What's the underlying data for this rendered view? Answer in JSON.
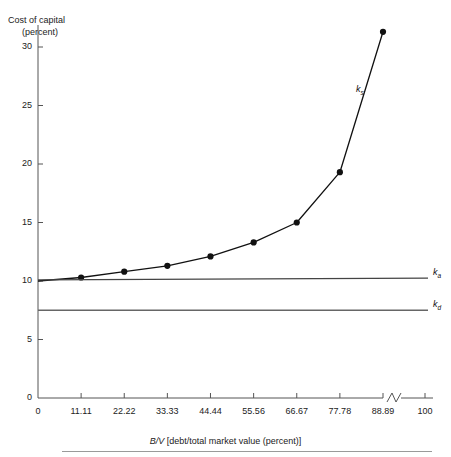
{
  "chart_data": {
    "type": "line",
    "title": "",
    "ylabel": "Cost of capital (percent)",
    "ylabel_line1": "Cost of capital",
    "ylabel_line2": "(percent)",
    "xlabel": "B/V [debt/total market value (percent)]",
    "xlabel_italic": "B/V",
    "xlabel_rest": " [debt/total market value (percent)]",
    "xlim": [
      0,
      100
    ],
    "ylim": [
      0,
      32
    ],
    "grid": false,
    "axis_break": {
      "between": [
        88.89,
        100
      ],
      "symbol": "zigzag"
    },
    "yticks": [
      0,
      5,
      10,
      15,
      20,
      25,
      30
    ],
    "ytick_labels": [
      "0",
      "5",
      "10",
      "15",
      "20",
      "25",
      "30"
    ],
    "xticks": [
      0,
      11.11,
      22.22,
      33.33,
      44.44,
      55.56,
      66.67,
      77.78,
      88.89,
      100
    ],
    "xtick_labels": [
      "0",
      "11.11",
      "22.22",
      "33.33",
      "44.44",
      "55.56",
      "66.67",
      "77.78",
      "88.89",
      "100"
    ],
    "series": [
      {
        "name": "k_s",
        "label": "k",
        "subscript": "s",
        "style": "curve-with-markers",
        "color": "#111111",
        "x": [
          0,
          11.11,
          22.22,
          33.33,
          44.44,
          55.56,
          66.67,
          77.78,
          88.89
        ],
        "values": [
          10.0,
          10.3,
          10.8,
          11.3,
          12.1,
          13.3,
          15.0,
          19.3,
          31.3
        ]
      },
      {
        "name": "k_a",
        "label": "k",
        "subscript": "a",
        "style": "horizontal-line",
        "color": "#444444",
        "x": [
          0,
          100
        ],
        "values": [
          10.1,
          10.25
        ]
      },
      {
        "name": "k_d",
        "label": "k",
        "subscript": "d",
        "style": "horizontal-line",
        "color": "#666666",
        "x": [
          0,
          100
        ],
        "values": [
          7.5,
          7.5
        ]
      }
    ]
  }
}
